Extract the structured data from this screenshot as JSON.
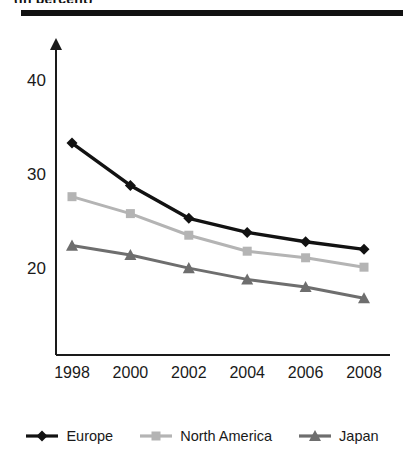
{
  "page": {
    "top_caption": "(in percent)"
  },
  "legend": {
    "position": "bottom-center",
    "items": [
      {
        "label": "Europe",
        "color": "#121212",
        "marker": "diamond"
      },
      {
        "label": "North America",
        "color": "#b4b4b4",
        "marker": "square"
      },
      {
        "label": "Japan",
        "color": "#6e6e6e",
        "marker": "triangle"
      }
    ]
  },
  "chart_data": {
    "type": "line",
    "title": "",
    "subtitle": "",
    "xlabel": "",
    "ylabel": "",
    "categories": [
      "1998",
      "2000",
      "2002",
      "2004",
      "2006",
      "2008"
    ],
    "x": [
      1998,
      2000,
      2002,
      2004,
      2006,
      2008
    ],
    "ylim": [
      14,
      44
    ],
    "yticks": [
      20,
      30,
      40
    ],
    "ytick_labels": [
      "20",
      "30",
      "40"
    ],
    "grid": false,
    "legend_position": "bottom-center",
    "series": [
      {
        "name": "Europe",
        "color": "#121212",
        "marker": "diamond",
        "values": [
          33.5,
          29.0,
          25.5,
          24.0,
          23.0,
          22.2
        ]
      },
      {
        "name": "North America",
        "color": "#b4b4b4",
        "marker": "square",
        "values": [
          27.8,
          26.0,
          23.7,
          22.0,
          21.3,
          20.3
        ]
      },
      {
        "name": "Japan",
        "color": "#6e6e6e",
        "marker": "triangle",
        "values": [
          22.6,
          21.6,
          20.2,
          19.0,
          18.2,
          17.0
        ]
      }
    ]
  }
}
